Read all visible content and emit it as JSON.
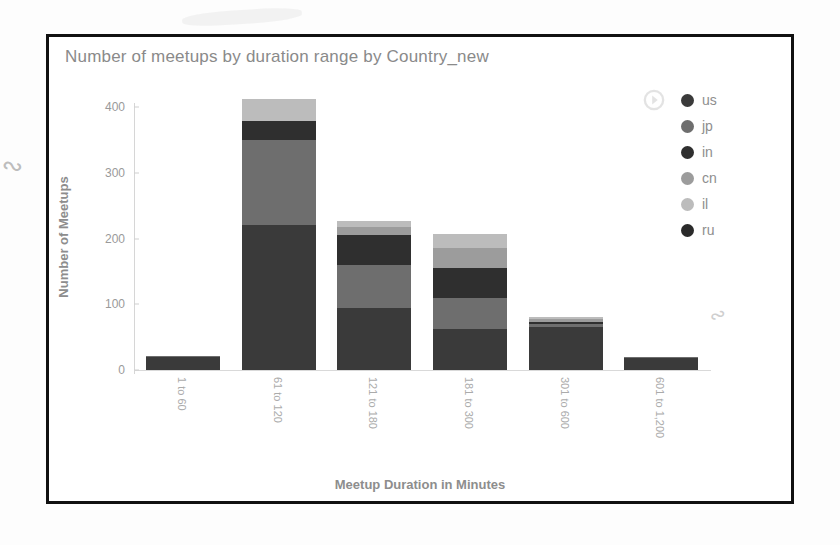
{
  "chart_data": {
    "type": "bar",
    "subtype": "stacked-bar",
    "title": "Number of meetups by duration range by Country_new",
    "xlabel": "Meetup Duration in Minutes",
    "ylabel": "Number of Meetups",
    "categories": [
      "1 to 60",
      "61 to 120",
      "121 to 180",
      "181 to 300",
      "301 to 600",
      "601 to 1,200"
    ],
    "ylim": [
      0,
      420
    ],
    "yticks": [
      0,
      100,
      200,
      300,
      400
    ],
    "ytick_labels": [
      "0",
      "100",
      "200",
      "300",
      "400"
    ],
    "grid": false,
    "legend_position": "right",
    "series": [
      {
        "name": "us",
        "color": "#3a3a3a",
        "values": [
          20,
          220,
          95,
          62,
          66,
          18
        ]
      },
      {
        "name": "jp",
        "color": "#6e6e6e",
        "values": [
          2,
          130,
          65,
          48,
          4,
          2
        ]
      },
      {
        "name": "in",
        "color": "#2f2f2f",
        "values": [
          0,
          28,
          45,
          45,
          3,
          0
        ]
      },
      {
        "name": "cn",
        "color": "#9c9c9c",
        "values": [
          0,
          0,
          12,
          30,
          4,
          0
        ]
      },
      {
        "name": "il",
        "color": "#bcbcbc",
        "values": [
          0,
          34,
          10,
          22,
          3,
          0
        ]
      },
      {
        "name": "ru",
        "color": "#2a2a2a",
        "values": [
          0,
          0,
          0,
          0,
          0,
          0
        ]
      }
    ],
    "totals": [
      22,
      412,
      227,
      207,
      80,
      20
    ]
  },
  "legend": {
    "expand_icon": "circle-arrow-right-icon",
    "items": [
      {
        "label": "us",
        "color": "#3a3a3a"
      },
      {
        "label": "jp",
        "color": "#6e6e6e"
      },
      {
        "label": "in",
        "color": "#2f2f2f"
      },
      {
        "label": "cn",
        "color": "#9c9c9c"
      },
      {
        "label": "il",
        "color": "#bcbcbc"
      },
      {
        "label": "ru",
        "color": "#2a2a2a"
      }
    ]
  }
}
